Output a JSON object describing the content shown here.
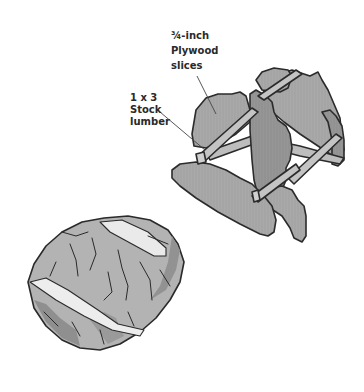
{
  "illustration": {
    "subject": "Wooden bread stand made of plywood slices and stock lumber, with a loaf of bread",
    "colors": {
      "background": "#ffffff",
      "wood_fill": "#a8a8a8",
      "wood_dark": "#8c8c8c",
      "outline": "#2b2b2b",
      "bread_fill": "#b4b4b4",
      "bread_shadow": "#8e8e8e",
      "bread_highlight": "#ececec"
    }
  },
  "callouts": {
    "plywood": {
      "line1": "¾-inch",
      "line2": "Plywood",
      "line3": "slices"
    },
    "lumber": {
      "line1": "1 x 3",
      "line2": "Stock",
      "line3": "lumber"
    }
  }
}
